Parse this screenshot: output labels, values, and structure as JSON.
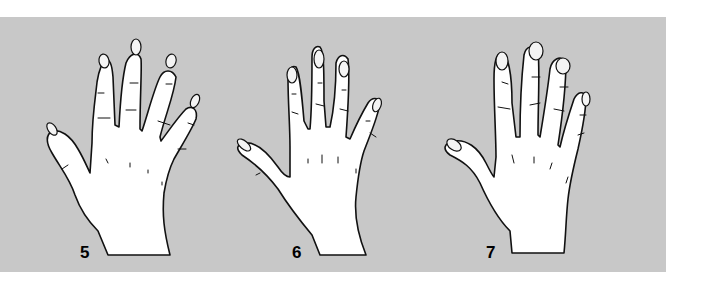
{
  "figures": [
    {
      "id": "hand-5",
      "label": "5"
    },
    {
      "id": "hand-6",
      "label": "6"
    },
    {
      "id": "hand-7",
      "label": "7"
    }
  ],
  "colors": {
    "background": "#ffffff",
    "panel": "#c8c8c8",
    "outline": "#111111",
    "hand_fill": "#ffffff"
  }
}
